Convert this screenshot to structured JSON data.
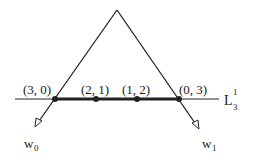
{
  "diagram": {
    "apex": {
      "x": 117,
      "y": 10
    },
    "line_label": {
      "main": "L",
      "sub": "3",
      "sup": "1"
    },
    "points": [
      {
        "label": "(3, 0)",
        "x": 55,
        "y": 99
      },
      {
        "label": "(2, 1)",
        "x": 96,
        "y": 99
      },
      {
        "label": "(1, 2)",
        "x": 137,
        "y": 99
      },
      {
        "label": "(0, 3)",
        "x": 179,
        "y": 99
      }
    ],
    "vectors": [
      {
        "label": "w",
        "sub": "0"
      },
      {
        "label": "w",
        "sub": "1"
      }
    ],
    "colors": {
      "stroke": "#222222",
      "background": "#ffffff"
    }
  }
}
